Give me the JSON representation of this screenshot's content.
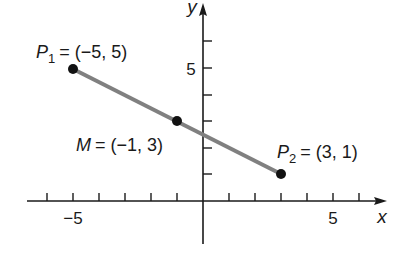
{
  "figure": {
    "type": "coordinate-plane-line-segment",
    "axes": {
      "x_label": "x",
      "y_label": "y",
      "x_tick_labels": [
        {
          "value": -5,
          "text": "−5"
        },
        {
          "value": 5,
          "text": "5"
        }
      ],
      "y_tick_labels": [
        {
          "value": 5,
          "text": "5"
        }
      ],
      "x_range": [
        -6,
        7
      ],
      "y_range": [
        -2,
        6
      ]
    },
    "points": [
      {
        "id": "P1",
        "name": "P",
        "subscript": "1",
        "coords": "= (−5, 5)",
        "x": -5,
        "y": 5
      },
      {
        "id": "M",
        "name": "M",
        "subscript": "",
        "coords": "= (−1, 3)",
        "x": -1,
        "y": 3
      },
      {
        "id": "P2",
        "name": "P",
        "subscript": "2",
        "coords": "= (3, 1)",
        "x": 3,
        "y": 1
      }
    ],
    "segment": {
      "from": "P1",
      "to": "P2",
      "color": "#808080"
    },
    "colors": {
      "axis": "#1a1a1a",
      "segment": "#808080",
      "point": "#111111"
    }
  }
}
